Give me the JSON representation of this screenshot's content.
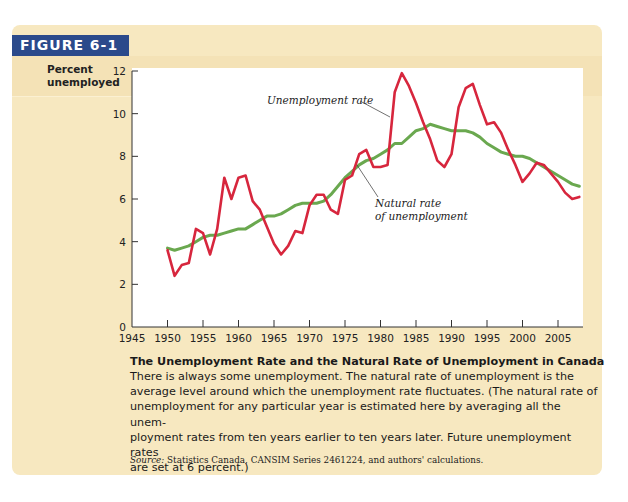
{
  "figure": {
    "label": "FIGURE 6-1",
    "label_bg": "#2b4a8b",
    "panel_bg": "#f7e8c0"
  },
  "axes": {
    "ylabel_line1": "Percent",
    "ylabel_line2": "unemployed",
    "yticks": [
      "0",
      "2",
      "4",
      "6",
      "8",
      "10",
      "12"
    ],
    "xticks": [
      "1945",
      "1950",
      "1955",
      "1960",
      "1965",
      "1970",
      "1975",
      "1980",
      "1985",
      "1990",
      "1995",
      "2000",
      "2005"
    ]
  },
  "annotations": {
    "unemployment": "Unemployment rate",
    "natural_line1": "Natural rate",
    "natural_line2": "of unemployment"
  },
  "caption": {
    "title": "The Unemployment Rate and the Natural Rate of Unemployment in Canada",
    "line1": "There is always some unemployment. The natural rate of unemployment is the",
    "line2": "average level around which the unemployment rate fluctuates. (The natural rate of",
    "line3": "unemployment for any particular year is estimated here by averaging all the unem-",
    "line4": "ployment rates from ten years earlier to ten years later. Future unemployment rates",
    "line5": "are set at 6 percent.)",
    "source_label": "Source:",
    "source_text": " Statistics Canada, CANSIM Series 2461224, and authors' calculations."
  },
  "chart_data": {
    "type": "line",
    "title": "The Unemployment Rate and the Natural Rate of Unemployment in Canada",
    "xlabel": "",
    "ylabel": "Percent unemployed",
    "xlim": [
      1945,
      2008
    ],
    "ylim": [
      0,
      12
    ],
    "grid": false,
    "legend": "inline annotations",
    "x": [
      1950,
      1951,
      1952,
      1953,
      1954,
      1955,
      1956,
      1957,
      1958,
      1959,
      1960,
      1961,
      1962,
      1963,
      1964,
      1965,
      1966,
      1967,
      1968,
      1969,
      1970,
      1971,
      1972,
      1973,
      1974,
      1975,
      1976,
      1977,
      1978,
      1979,
      1980,
      1981,
      1982,
      1983,
      1984,
      1985,
      1986,
      1987,
      1988,
      1989,
      1990,
      1991,
      1992,
      1993,
      1994,
      1995,
      1996,
      1997,
      1998,
      1999,
      2000,
      2001,
      2002,
      2003,
      2004,
      2005,
      2006,
      2007,
      2008
    ],
    "series": [
      {
        "name": "Unemployment rate",
        "color": "#d7263d",
        "values": [
          3.6,
          2.4,
          2.9,
          3.0,
          4.6,
          4.4,
          3.4,
          4.6,
          7.0,
          6.0,
          7.0,
          7.1,
          5.9,
          5.5,
          4.7,
          3.9,
          3.4,
          3.8,
          4.5,
          4.4,
          5.7,
          6.2,
          6.2,
          5.5,
          5.3,
          6.9,
          7.1,
          8.1,
          8.3,
          7.5,
          7.5,
          7.6,
          11.0,
          11.9,
          11.3,
          10.5,
          9.6,
          8.8,
          7.8,
          7.5,
          8.1,
          10.3,
          11.2,
          11.4,
          10.4,
          9.5,
          9.6,
          9.1,
          8.3,
          7.6,
          6.8,
          7.2,
          7.7,
          7.6,
          7.2,
          6.8,
          6.3,
          6.0,
          6.1
        ]
      },
      {
        "name": "Natural rate of unemployment",
        "color": "#6aa84f",
        "values": [
          3.7,
          3.6,
          3.7,
          3.8,
          4.0,
          4.2,
          4.3,
          4.3,
          4.4,
          4.5,
          4.6,
          4.6,
          4.8,
          5.0,
          5.2,
          5.2,
          5.3,
          5.5,
          5.7,
          5.8,
          5.8,
          5.8,
          5.9,
          6.2,
          6.6,
          7.0,
          7.3,
          7.6,
          7.8,
          7.9,
          8.1,
          8.3,
          8.6,
          8.6,
          8.9,
          9.2,
          9.3,
          9.5,
          9.4,
          9.3,
          9.2,
          9.2,
          9.2,
          9.1,
          8.9,
          8.6,
          8.4,
          8.2,
          8.1,
          8.0,
          8.0,
          7.9,
          7.7,
          7.5,
          7.3,
          7.1,
          6.9,
          6.7,
          6.6
        ]
      }
    ]
  }
}
